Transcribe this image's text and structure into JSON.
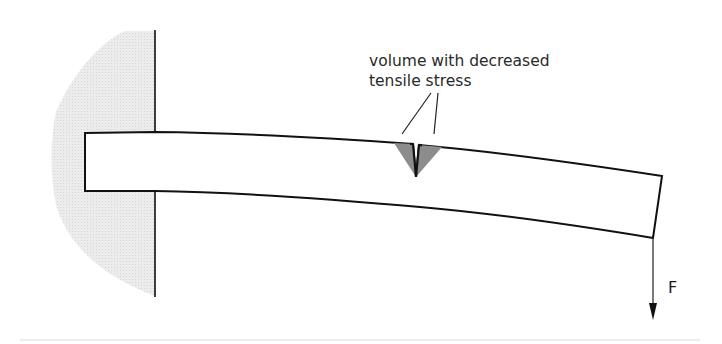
{
  "diagram": {
    "type": "cantilever-beam-with-notch",
    "annotation": {
      "line1": "volume with decreased",
      "line2": "tensile stress"
    },
    "force": {
      "label": "F",
      "direction": "down"
    },
    "colors": {
      "wall_fill": "#e6e6e6",
      "notch_zone_fill": "#8c8c8c",
      "stroke": "#111111",
      "beam_fill": "#ffffff"
    }
  }
}
